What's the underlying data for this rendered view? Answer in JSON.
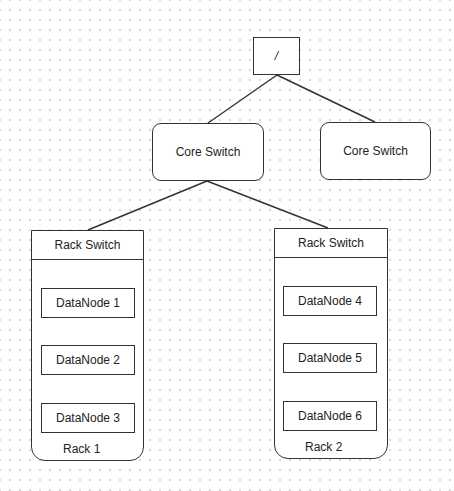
{
  "root": {
    "label": "/"
  },
  "core_switches": [
    {
      "label": "Core Switch"
    },
    {
      "label": "Core Switch"
    }
  ],
  "racks": [
    {
      "switch_label": "Rack Switch",
      "label": "Rack 1",
      "nodes": [
        {
          "label": "DataNode 1"
        },
        {
          "label": "DataNode 2"
        },
        {
          "label": "DataNode 3"
        }
      ]
    },
    {
      "switch_label": "Rack Switch",
      "label": "Rack 2",
      "nodes": [
        {
          "label": "DataNode 4"
        },
        {
          "label": "DataNode 5"
        },
        {
          "label": "DataNode 6"
        }
      ]
    }
  ],
  "connections": [
    {
      "from": "/",
      "to": "Core Switch (left)"
    },
    {
      "from": "/",
      "to": "Core Switch (right)"
    },
    {
      "from": "Core Switch (left)",
      "to": "Rack 1 Rack Switch"
    },
    {
      "from": "Core Switch (left)",
      "to": "Rack 2 Rack Switch"
    }
  ],
  "colors": {
    "stroke": "#333333",
    "background": "#ffffff",
    "grid_dot": "#d9d9d9"
  }
}
